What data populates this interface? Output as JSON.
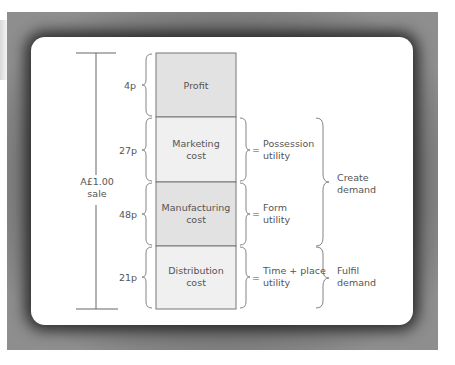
{
  "diagram": {
    "total_label": [
      "A£1.00",
      "sale"
    ],
    "segments": [
      {
        "name": "profit",
        "value": "4p",
        "label": [
          "Profit"
        ],
        "fill": "#e2e2e2",
        "top": 53,
        "bottom": 117
      },
      {
        "name": "marketing",
        "value": "27p",
        "label": [
          "Marketing",
          "cost"
        ],
        "fill": "#f0f0f0",
        "top": 117,
        "bottom": 182
      },
      {
        "name": "manufacturing",
        "value": "48p",
        "label": [
          "Manufacturing",
          "cost"
        ],
        "fill": "#e2e2e2",
        "top": 182,
        "bottom": 246
      },
      {
        "name": "distribution",
        "value": "21p",
        "label": [
          "Distribution",
          "cost"
        ],
        "fill": "#f0f0f0",
        "top": 246,
        "bottom": 309
      }
    ],
    "utilities": [
      {
        "segment": "marketing",
        "prefix": "=",
        "label": [
          "Possession",
          "utility"
        ]
      },
      {
        "segment": "manufacturing",
        "prefix": "=",
        "label": [
          "Form",
          "utility"
        ]
      },
      {
        "segment": "distribution",
        "prefix": "=",
        "label": [
          "Time + place",
          "utility"
        ]
      }
    ],
    "groups": [
      {
        "name": "create-demand",
        "label": [
          "Create",
          "demand"
        ],
        "top": 117,
        "bottom": 246
      },
      {
        "name": "fulfil-demand",
        "label": [
          "Fulfil",
          "demand"
        ],
        "top": 246,
        "bottom": 309
      }
    ],
    "colors": {
      "line": "#666666",
      "text": "#555555",
      "frame": "#8e8e8e"
    }
  }
}
